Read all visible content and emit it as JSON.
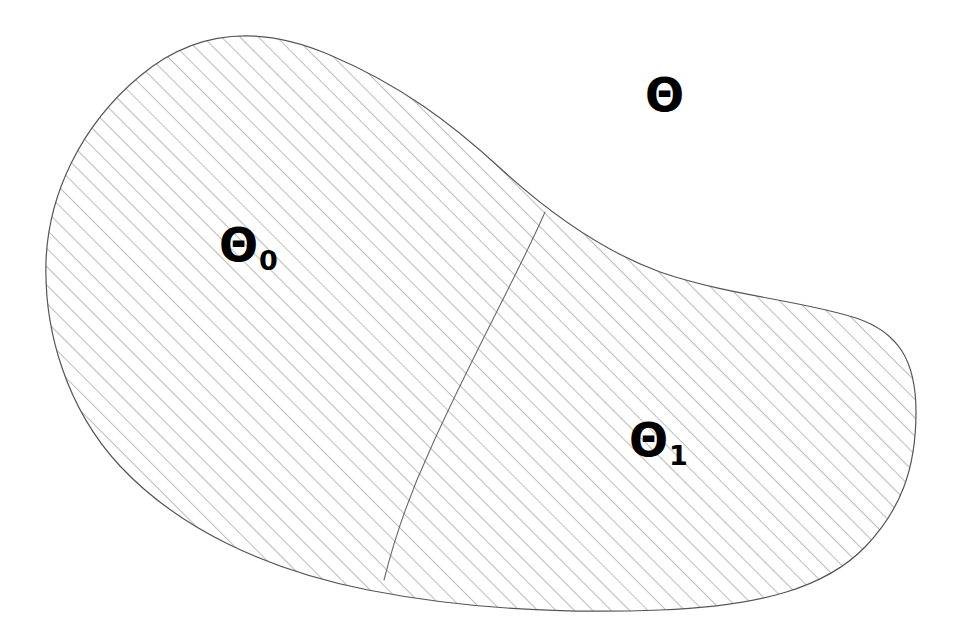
{
  "figure": {
    "type": "diagram",
    "background_color": "#ffffff",
    "outline_color": "#555555",
    "hatch_color": "#8a8a8a",
    "text_color": "#000000"
  },
  "labels": {
    "parameter_space": {
      "base": "Θ",
      "sub": ""
    },
    "null_region": {
      "base": "Θ",
      "sub": "0"
    },
    "alternative_region": {
      "base": "Θ",
      "sub": "1"
    }
  },
  "regions": {
    "outer_region_name": "Θ",
    "left_region_name": "Θ₀",
    "right_region_name": "Θ₁",
    "fill_pattern": "diagonal-hatch-45deg",
    "hatch_spacing_px": 13
  },
  "geometry": {
    "blob_path": "M 46 262 C 48 196 80 126 140 76 C 196 29 260 25 330 55 C 400 85 450 122 500 168 C 548 212 600 250 660 272 C 730 296 800 300 856 318 C 898 332 916 360 916 412 C 916 470 900 510 866 546 C 826 588 760 606 660 610 C 560 614 460 608 368 590 C 268 570 180 530 120 466 C 66 408 44 330 46 262 Z",
    "divider_path": "M 545 212 C 520 270 470 360 430 450 C 406 502 392 548 384 580",
    "label_positions": {
      "parameter_space": {
        "x": 645,
        "y": 72
      },
      "null_region": {
        "x": 219,
        "y": 222
      },
      "alternative_region": {
        "x": 629,
        "y": 417
      }
    }
  }
}
